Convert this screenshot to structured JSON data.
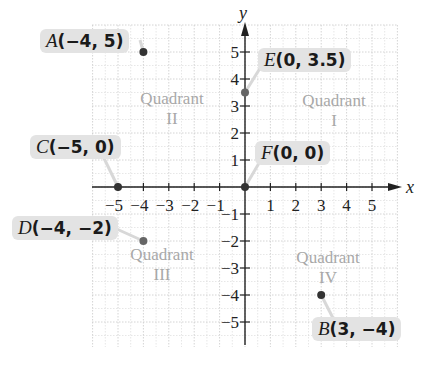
{
  "chart_data": {
    "type": "scatter",
    "title": "",
    "xlabel": "x",
    "ylabel": "y",
    "xlim": [
      -6,
      6
    ],
    "ylim": [
      -6,
      6
    ],
    "grid": true,
    "x_ticks": [
      -5,
      -4,
      -3,
      -2,
      -1,
      1,
      2,
      3,
      4,
      5
    ],
    "y_ticks": [
      -5,
      -4,
      -3,
      -2,
      -1,
      1,
      2,
      3,
      4,
      5
    ],
    "points": [
      {
        "name": "A",
        "x": -4,
        "y": 5,
        "label": "(−4, 5)"
      },
      {
        "name": "B",
        "x": 3,
        "y": -4,
        "label": "(3, −4)"
      },
      {
        "name": "C",
        "x": -5,
        "y": 0,
        "label": "(−5, 0)"
      },
      {
        "name": "D",
        "x": -4,
        "y": -2,
        "label": "(−4, −2)"
      },
      {
        "name": "E",
        "x": 0,
        "y": 3.5,
        "label": "(0, 3.5)"
      },
      {
        "name": "F",
        "x": 0,
        "y": 0,
        "label": "(0, 0)"
      }
    ],
    "annotations": [
      {
        "text": "Quadrant II",
        "quadrant": 2
      },
      {
        "text": "Quadrant I",
        "quadrant": 1
      },
      {
        "text": "Quadrant III",
        "quadrant": 3
      },
      {
        "text": "Quadrant IV",
        "quadrant": 4
      }
    ]
  },
  "labels": {
    "A": {
      "name": "A",
      "coords": "(−4, 5)"
    },
    "B": {
      "name": "B",
      "coords": "(3, −4)"
    },
    "C": {
      "name": "C",
      "coords": "(−5, 0)"
    },
    "D": {
      "name": "D",
      "coords": "(−4, −2)"
    },
    "E": {
      "name": "E",
      "coords": "(0, 3.5)"
    },
    "F": {
      "name": "F",
      "coords": "(0, 0)"
    }
  },
  "quadrants": {
    "q1": {
      "word": "Quadrant",
      "num": "I"
    },
    "q2": {
      "word": "Quadrant",
      "num": "II"
    },
    "q3": {
      "word": "Quadrant",
      "num": "III"
    },
    "q4": {
      "word": "Quadrant",
      "num": "IV"
    }
  },
  "axes": {
    "x": "x",
    "y": "y"
  },
  "colors": {
    "point": "#333333",
    "grid": "#cfcfcf",
    "axis": "#222222",
    "quadrant_text": "#a8a8a8",
    "label_bg": "#e3e3e3"
  }
}
